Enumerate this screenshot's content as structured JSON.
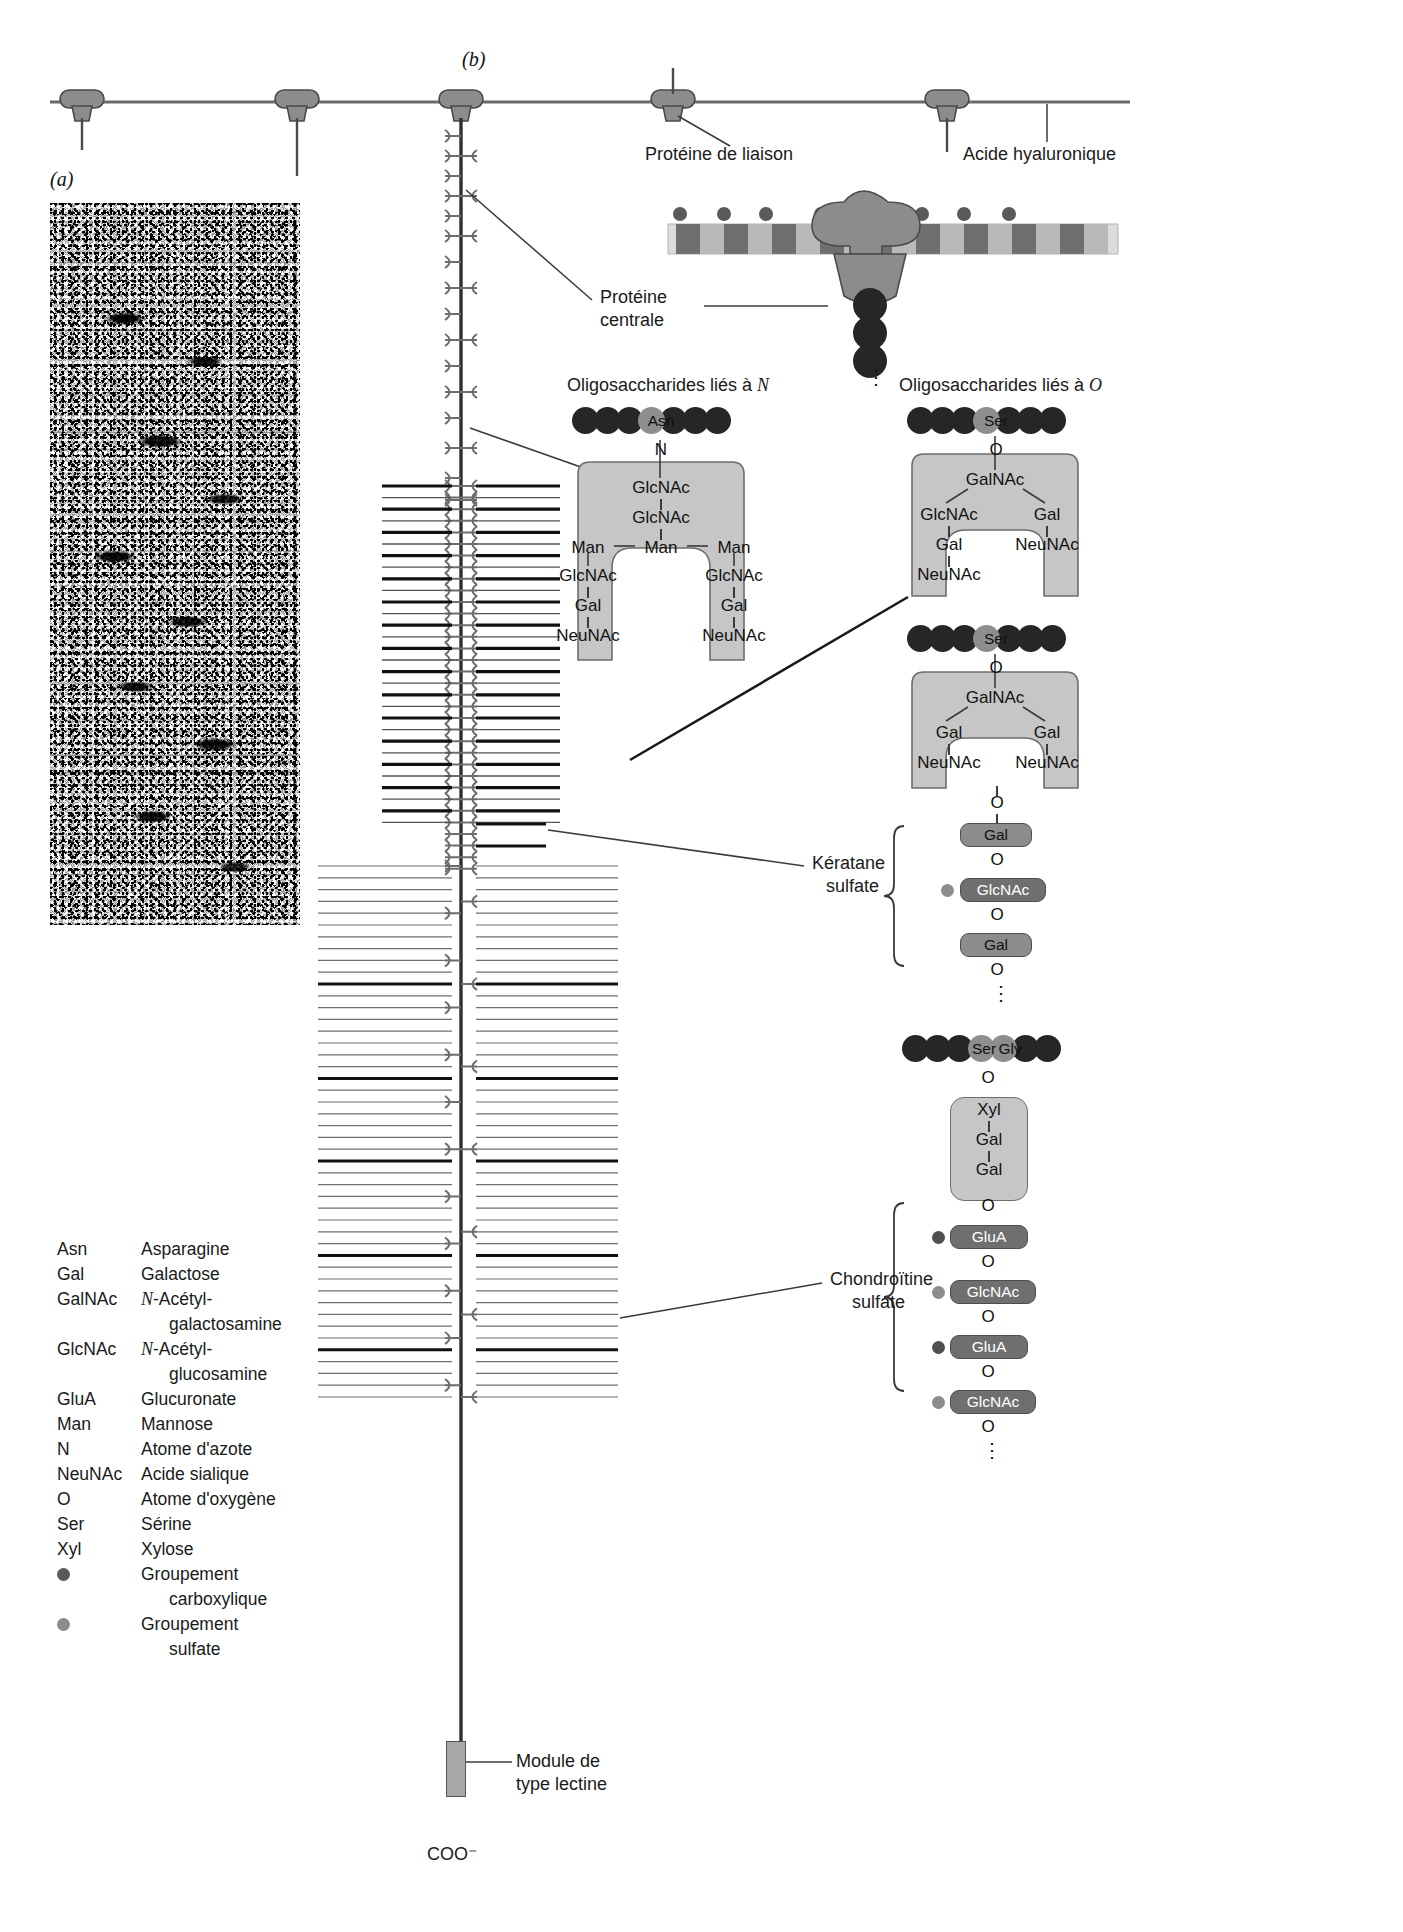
{
  "figure": {
    "panel_a_label": "(a)",
    "panel_b_label": "(b)"
  },
  "callouts": {
    "link_protein": "Protéine de liaison",
    "hyaluronic_acid": "Acide hyaluronique",
    "core_protein_line1": "Protéine",
    "core_protein_line2": "centrale",
    "n_linked_title_prefix": "Oligosaccharides liés à ",
    "n_linked_title_italic": "N",
    "o_linked_title_prefix": "Oligosaccharides liés à ",
    "o_linked_title_italic": "O",
    "keratan_line1": "Kératane",
    "keratan_line2": "sulfate",
    "chondroitin_line1": "Chondroïtine",
    "chondroitin_line2": "sulfate",
    "lectin_line1": "Module de",
    "lectin_line2": "type lectine",
    "c_terminus": "COO⁻"
  },
  "legend": [
    {
      "abbr": "Asn",
      "def": "Asparagine",
      "cont": "",
      "italic_prefix": ""
    },
    {
      "abbr": "Gal",
      "def": "Galactose",
      "cont": "",
      "italic_prefix": ""
    },
    {
      "abbr": "GalNAc",
      "def": "-Acétyl-",
      "cont": "galactosamine",
      "italic_prefix": "N"
    },
    {
      "abbr": "GlcNAc",
      "def": "-Acétyl-",
      "cont": "glucosamine",
      "italic_prefix": "N"
    },
    {
      "abbr": "GluA",
      "def": "Glucuronate",
      "cont": "",
      "italic_prefix": ""
    },
    {
      "abbr": "Man",
      "def": "Mannose",
      "cont": "",
      "italic_prefix": ""
    },
    {
      "abbr": "N",
      "def": "Atome d'azote",
      "cont": "",
      "italic_prefix": ""
    },
    {
      "abbr": "NeuNAc",
      "def": "Acide sialique",
      "cont": "",
      "italic_prefix": ""
    },
    {
      "abbr": "O",
      "def": "Atome d'oxygène",
      "cont": "",
      "italic_prefix": ""
    },
    {
      "abbr": "Ser",
      "def": "Sérine",
      "cont": "",
      "italic_prefix": ""
    },
    {
      "abbr": "Xyl",
      "def": "Xylose",
      "cont": "",
      "italic_prefix": ""
    }
  ],
  "legend_symbols": [
    {
      "symbol": "carboxyl-group-dot",
      "def": "Groupement",
      "cont": "carboxylique",
      "color": "#595959"
    },
    {
      "symbol": "sulfate-group-dot",
      "def": "Groupement",
      "cont": "sulfate",
      "color": "#8c8c8c"
    }
  ],
  "n_glycan": {
    "peptide_residue": "Asn",
    "link_atom": "N",
    "stem": [
      "GlcNAc",
      "GlcNAc"
    ],
    "branch_center": "Man",
    "branch_left": "Man",
    "branch_right": "Man",
    "arm_left": [
      "GlcNAc",
      "Gal",
      "NeuNAc"
    ],
    "arm_right": [
      "GlcNAc",
      "Gal",
      "NeuNAc"
    ]
  },
  "o_glycan_1": {
    "peptide_residue": "Ser",
    "link_atom": "O",
    "core": "GalNAc",
    "arm_left": [
      "GlcNAc",
      "Gal",
      "NeuNAc"
    ],
    "arm_right": [
      "Gal",
      "NeuNAc"
    ]
  },
  "o_glycan_2": {
    "peptide_residue": "Ser",
    "link_atom": "O",
    "core": "GalNAc",
    "arm_left": [
      "Gal",
      "NeuNAc"
    ],
    "arm_right": [
      "Gal",
      "NeuNAc"
    ]
  },
  "keratan_sulfate": {
    "link_atom": "O",
    "units": [
      {
        "sugar": "Gal",
        "dot": "none"
      },
      {
        "sugar": "GlcNAc",
        "dot": "sulfate"
      },
      {
        "sugar": "Gal",
        "dot": "none"
      }
    ],
    "bond_atom": "O",
    "continues": "⋮"
  },
  "chondroitin_sulfate": {
    "peptide_residues": [
      "Ser",
      "Gly"
    ],
    "link_atom": "O",
    "linker": [
      "Xyl",
      "Gal",
      "Gal"
    ],
    "units": [
      {
        "sugar": "GluA",
        "dot": "carboxyl"
      },
      {
        "sugar": "GlcNAc",
        "dot": "sulfate"
      },
      {
        "sugar": "GluA",
        "dot": "carboxyl"
      },
      {
        "sugar": "GlcNAc",
        "dot": "sulfate"
      }
    ],
    "bond_atom": "O",
    "continues": "⋮"
  },
  "colors": {
    "protein_gray": "#8c8c8c",
    "glycan_fill": "#c6c6c6",
    "bead_dark": "#262626",
    "bead_residue": "#8e8e8e",
    "carboxyl": "#4f4f4f",
    "sulfate": "#8c8c8c",
    "line": "#3a3a3a"
  },
  "link_protein_complex": {
    "core_protein_label": "Protéine centrale"
  }
}
